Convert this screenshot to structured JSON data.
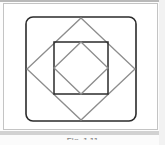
{
  "figure": {
    "caption": "Fig. 1.11",
    "background_color": "#ffffff",
    "frame_border_color": "#c4c4c4",
    "panel": {
      "width": 155,
      "height": 127
    },
    "shapes": [
      {
        "name": "outer-rounded-square",
        "type": "rounded-square",
        "x": 22,
        "y": 13,
        "width": 110,
        "height": 104,
        "corner_radius": 7,
        "stroke_color": "#2b2b2b",
        "stroke_width": 1.6,
        "fill": "none"
      },
      {
        "name": "large-diamond",
        "type": "diamond",
        "points": "77,14 131,65 77,116 23,65",
        "stroke_color": "#8d8d8d",
        "stroke_width": 1.3,
        "fill": "none"
      },
      {
        "name": "inner-square",
        "type": "square",
        "x": 50,
        "y": 38,
        "width": 54,
        "height": 52,
        "stroke_color": "#2b2b2b",
        "stroke_width": 1.5,
        "fill": "none"
      },
      {
        "name": "inner-diamond",
        "type": "diamond",
        "points": "77,38 104,64 77,90 50,64",
        "stroke_color": "#8d8d8d",
        "stroke_width": 1.3,
        "fill": "none"
      }
    ],
    "shape_count": 4
  },
  "colors": {
    "dark_stroke": "#2b2b2b",
    "light_stroke": "#8d8d8d",
    "band": "#d2d2d2",
    "page": "#fdfdfd"
  }
}
